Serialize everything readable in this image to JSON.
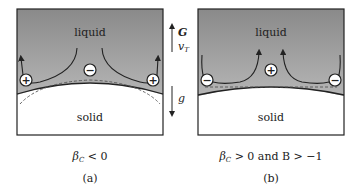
{
  "panels": [
    {
      "id": "a",
      "liquid_label": "liquid",
      "solid_label": "solid",
      "center_sign": "−",
      "side_sign": "+",
      "condition": "β_C < 0",
      "condition_parts": {
        "symbol": "β",
        "sub": "C",
        "rest": " < 0"
      },
      "tag": "(a)"
    },
    {
      "id": "b",
      "liquid_label": "liquid",
      "solid_label": "solid",
      "center_sign": "+",
      "side_sign": "−",
      "condition": "β_C > 0 and B > −1",
      "condition_parts": {
        "symbol": "β",
        "sub": "C",
        "rest": " > 0 and B > −1"
      },
      "tag": "(b)"
    }
  ],
  "arrows": {
    "up_labels": [
      "G",
      "v"
    ],
    "up_label_sub": "T",
    "down_label": "g"
  },
  "colors": {
    "liquid_top": "#8a8a8a",
    "liquid_bottom": "#c4c4c4",
    "solid": "#ffffff",
    "frame": "#222222"
  }
}
